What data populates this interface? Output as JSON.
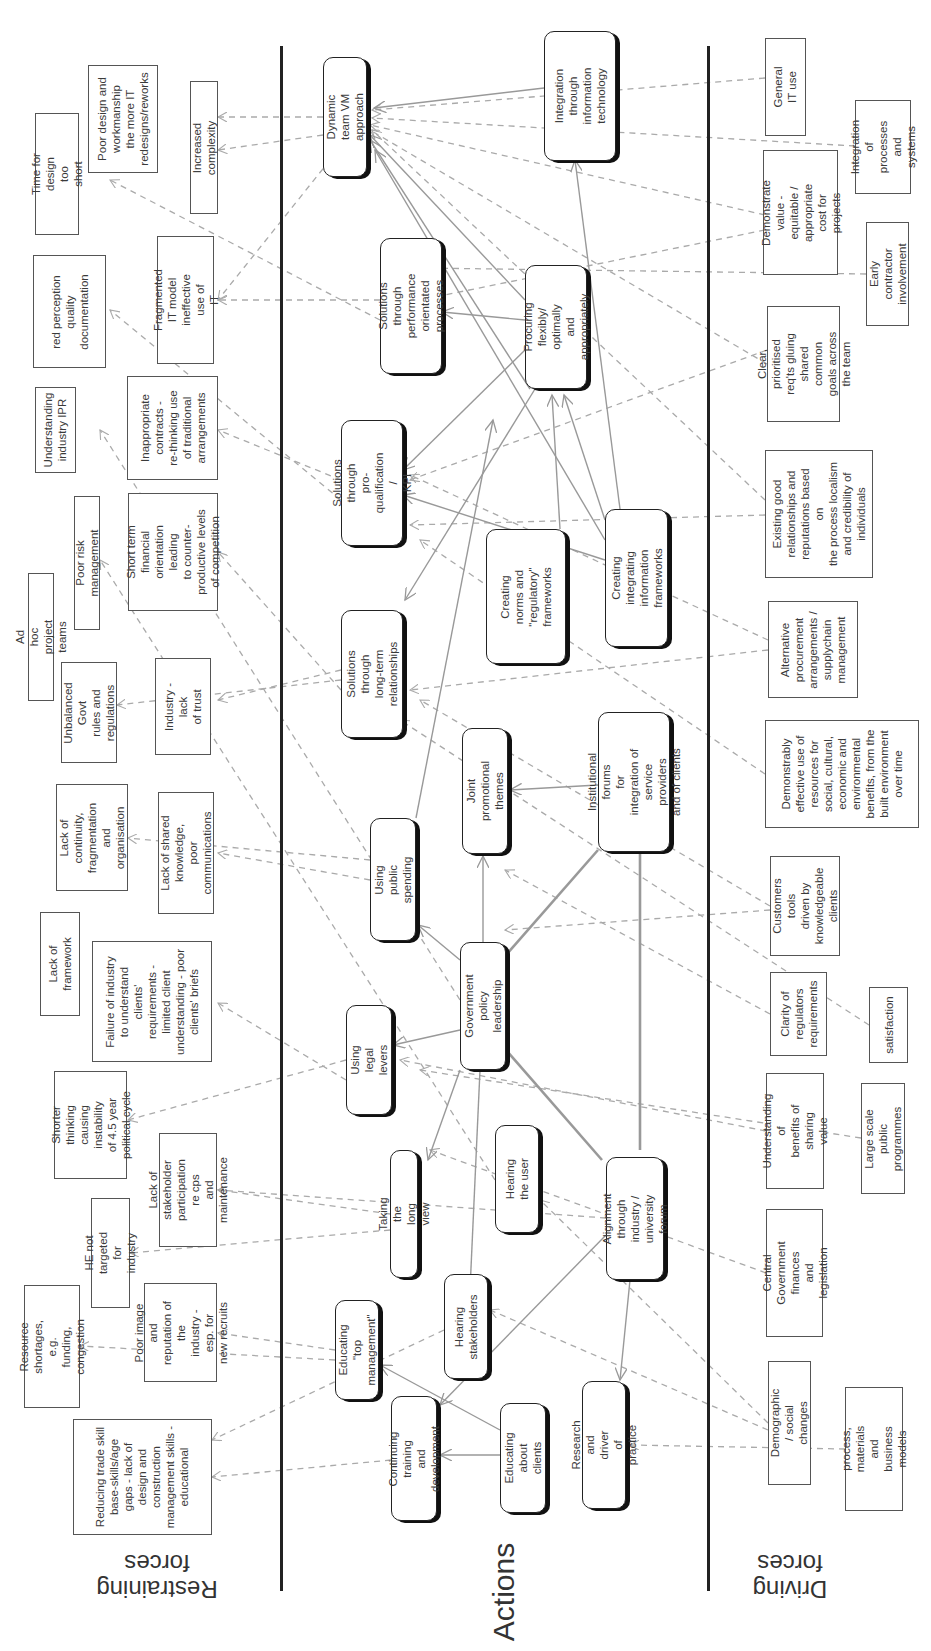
{
  "sections": {
    "restraining_label": "Restraining\nforces",
    "actions_label": "Actions",
    "driving_label": "Driving\nforces"
  },
  "restraining_forces": [
    {
      "id": "r1",
      "text": "Poor design and\nworkmanship\nthe more IT\nredesigns/reworks",
      "x": 88,
      "y": 65,
      "w": 70,
      "h": 108
    },
    {
      "id": "r2",
      "text": "Time for design too\nshort",
      "x": 35,
      "y": 113,
      "w": 44,
      "h": 122
    },
    {
      "id": "r3",
      "text": "Increased complexity",
      "x": 190,
      "y": 81,
      "w": 28,
      "h": 133
    },
    {
      "id": "r4",
      "text": "red perception\nquality\ndocumentation",
      "x": 33,
      "y": 255,
      "w": 73,
      "h": 113
    },
    {
      "id": "r5",
      "text": "Fragmented IT model\nineffective use of\nIT",
      "x": 157,
      "y": 236,
      "w": 57,
      "h": 128
    },
    {
      "id": "r6",
      "text": "Understanding\nindustry IPR",
      "x": 35,
      "y": 387,
      "w": 41,
      "h": 86
    },
    {
      "id": "r7",
      "text": "Inappropriate\ncontracts -\nre-thinking use\nof traditional\narrangements",
      "x": 127,
      "y": 376,
      "w": 91,
      "h": 104
    },
    {
      "id": "r8",
      "text": "Poor risk management",
      "x": 74,
      "y": 496,
      "w": 26,
      "h": 134
    },
    {
      "id": "r9",
      "text": "Short term financial\norientation leading\nto counter-\nproductive levels\nof competition",
      "x": 128,
      "y": 493,
      "w": 90,
      "h": 118
    },
    {
      "id": "r10",
      "text": "Ad hoc project teams",
      "x": 28,
      "y": 573,
      "w": 26,
      "h": 128
    },
    {
      "id": "r11",
      "text": "Unbalanced Govt\nrules and\nregulations",
      "x": 61,
      "y": 662,
      "w": 56,
      "h": 101
    },
    {
      "id": "r12",
      "text": "Industry - lack\nof trust",
      "x": 155,
      "y": 658,
      "w": 56,
      "h": 97
    },
    {
      "id": "r13",
      "text": "Lack of continuity,\nfragmentation and\norganisation",
      "x": 56,
      "y": 784,
      "w": 72,
      "h": 107
    },
    {
      "id": "r14",
      "text": "Lack of shared\nknowledge, poor\ncommunications",
      "x": 158,
      "y": 792,
      "w": 56,
      "h": 122
    },
    {
      "id": "r15",
      "text": "Lack of framework",
      "x": 40,
      "y": 912,
      "w": 40,
      "h": 104
    },
    {
      "id": "r16",
      "text": "Failure of industry\nto understand\nclients'\nrequirements -\nlimited client\nunderstanding - poor\nclients' briefs",
      "x": 92,
      "y": 941,
      "w": 120,
      "h": 121
    },
    {
      "id": "r17",
      "text": "Shorter thinking\ncausing instability\nof 4.5 year\npolitical cycle",
      "x": 54,
      "y": 1071,
      "w": 73,
      "h": 108
    },
    {
      "id": "r18",
      "text": "Lack of stakeholder\nparticipation re cps\nand maintenance",
      "x": 159,
      "y": 1133,
      "w": 58,
      "h": 114
    },
    {
      "id": "r19",
      "text": "HE not targeted for\nindustry",
      "x": 91,
      "y": 1198,
      "w": 39,
      "h": 110
    },
    {
      "id": "r20",
      "text": "Poor image and\nreputation of the\nindustry - esp. for\nnew recruits",
      "x": 144,
      "y": 1283,
      "w": 73,
      "h": 99
    },
    {
      "id": "r21",
      "text": "Resource shortages,\ne.g. funding,\ncongestion",
      "x": 24,
      "y": 1285,
      "w": 56,
      "h": 123
    },
    {
      "id": "r22",
      "text": "Reducing trade skill\nbase-skills/age\ngaps - lack of\ndesign and\nconstruction\nmanagement skills -\neducational",
      "x": 73,
      "y": 1419,
      "w": 139,
      "h": 116
    }
  ],
  "actions": [
    {
      "id": "a1",
      "text": "Dynamic team VM\napproach",
      "x": 323,
      "y": 57,
      "w": 44,
      "h": 120
    },
    {
      "id": "a2",
      "text": "Integration through\ninformation\ntechnology",
      "x": 544,
      "y": 31,
      "w": 72,
      "h": 130
    },
    {
      "id": "a3",
      "text": "Solutions through\nperformance\norientated processes",
      "x": 380,
      "y": 238,
      "w": 62,
      "h": 136
    },
    {
      "id": "a4",
      "text": "Procuring flexibly/\noptimally and\nappropriately",
      "x": 525,
      "y": 265,
      "w": 62,
      "h": 124
    },
    {
      "id": "a5",
      "text": "Solutions through\npro-qualification /\nKPI",
      "x": 341,
      "y": 420,
      "w": 62,
      "h": 126
    },
    {
      "id": "a6",
      "text": "Creating\nnorms and\n\"regulatory\"\nframeworks",
      "x": 486,
      "y": 529,
      "w": 80,
      "h": 135
    },
    {
      "id": "a7",
      "text": "Creating integrating\ninformation\nframeworks",
      "x": 605,
      "y": 509,
      "w": 63,
      "h": 138
    },
    {
      "id": "a8",
      "text": "Solutions through\nlong-term\nrelationships",
      "x": 341,
      "y": 610,
      "w": 62,
      "h": 128
    },
    {
      "id": "a9",
      "text": "Joint promotional\nthemes",
      "x": 462,
      "y": 728,
      "w": 46,
      "h": 126
    },
    {
      "id": "a10",
      "text": "Institutional forums\nfor integration of\nservice providers\nand of clients",
      "x": 598,
      "y": 712,
      "w": 72,
      "h": 140
    },
    {
      "id": "a11",
      "text": "Using public\nspending",
      "x": 370,
      "y": 818,
      "w": 46,
      "h": 123
    },
    {
      "id": "a12",
      "text": "Government policy\nleadership",
      "x": 460,
      "y": 942,
      "w": 46,
      "h": 128
    },
    {
      "id": "a13",
      "text": "Using legal\nlevers",
      "x": 346,
      "y": 1005,
      "w": 46,
      "h": 110
    },
    {
      "id": "a14",
      "text": "Hearing the user",
      "x": 495,
      "y": 1125,
      "w": 44,
      "h": 108
    },
    {
      "id": "a15",
      "text": "Taking the long view",
      "x": 390,
      "y": 1150,
      "w": 28,
      "h": 128
    },
    {
      "id": "a16",
      "text": "Alignment through\nindustry /\nuniversity forum",
      "x": 606,
      "y": 1157,
      "w": 58,
      "h": 123
    },
    {
      "id": "a17",
      "text": "Hearing\nstakeholders",
      "x": 444,
      "y": 1274,
      "w": 44,
      "h": 105
    },
    {
      "id": "a18",
      "text": "Educating \"top\nmanagement\"",
      "x": 335,
      "y": 1300,
      "w": 44,
      "h": 100
    },
    {
      "id": "a19",
      "text": "Continuing training\nand development",
      "x": 391,
      "y": 1396,
      "w": 46,
      "h": 125
    },
    {
      "id": "a20",
      "text": "Educating about\nclients",
      "x": 500,
      "y": 1403,
      "w": 46,
      "h": 110
    },
    {
      "id": "a21",
      "text": "Research and driver\nof practice",
      "x": 582,
      "y": 1381,
      "w": 44,
      "h": 128
    }
  ],
  "driving_forces": [
    {
      "id": "d1",
      "text": "General\nIT use",
      "x": 765,
      "y": 38,
      "w": 41,
      "h": 98
    },
    {
      "id": "d2",
      "text": "Integration of\nprocesses and\nsystems",
      "x": 855,
      "y": 100,
      "w": 56,
      "h": 94
    },
    {
      "id": "d3",
      "text": "Demonstrate value -\nequitable /\nappropriate cost for\nprojects",
      "x": 763,
      "y": 150,
      "w": 75,
      "h": 125
    },
    {
      "id": "d4",
      "text": "Early contractor\ninvolvement",
      "x": 866,
      "y": 222,
      "w": 43,
      "h": 104
    },
    {
      "id": "d5",
      "text": "Clear, prioritised\nreq'ts gluing shared\ncommon goals across\nthe team",
      "x": 767,
      "y": 306,
      "w": 73,
      "h": 116
    },
    {
      "id": "d6",
      "text": "Existing good\nrelationships and\nreputations based on\nthe process localism\nand credibility of\nindividuals",
      "x": 765,
      "y": 450,
      "w": 108,
      "h": 128
    },
    {
      "id": "d7",
      "text": "Alternative\nprocurement\narrangements /\nsupplychain\nmanagement",
      "x": 768,
      "y": 601,
      "w": 90,
      "h": 97
    },
    {
      "id": "d8",
      "text": "Demonstrably\neffective use of\nresources for\nsocial, cultural,\neconomic and\nenvironmental\nbenefits, from the\nbuilt environment\nover time",
      "x": 765,
      "y": 720,
      "w": 154,
      "h": 108
    },
    {
      "id": "d9",
      "text": "Customers tools\ndriven by\nknowledgeable\nclients",
      "x": 770,
      "y": 856,
      "w": 70,
      "h": 100
    },
    {
      "id": "d10",
      "text": "Clarity of\nregulators\nrequirements",
      "x": 770,
      "y": 972,
      "w": 57,
      "h": 84
    },
    {
      "id": "d11",
      "text": "satisfaction",
      "x": 869,
      "y": 987,
      "w": 39,
      "h": 76
    },
    {
      "id": "d12",
      "text": "Understanding of\nbenefits of sharing\nvalue",
      "x": 766,
      "y": 1073,
      "w": 58,
      "h": 116
    },
    {
      "id": "d13",
      "text": "Large scale public\nprogrammes",
      "x": 861,
      "y": 1083,
      "w": 44,
      "h": 111
    },
    {
      "id": "d14",
      "text": "Central Government\nfinances and\nlegislation",
      "x": 766,
      "y": 1209,
      "w": 57,
      "h": 128
    },
    {
      "id": "d15",
      "text": "Demographic / social\nchanges",
      "x": 768,
      "y": 1361,
      "w": 43,
      "h": 124
    },
    {
      "id": "d16",
      "text": "process, materials\nand\nbusiness models",
      "x": 845,
      "y": 1387,
      "w": 58,
      "h": 124
    }
  ],
  "colors": {
    "divider": "#222222",
    "solid_link": "#999999",
    "dashed_link": "#aaaaaa",
    "box_border": "#555555"
  }
}
